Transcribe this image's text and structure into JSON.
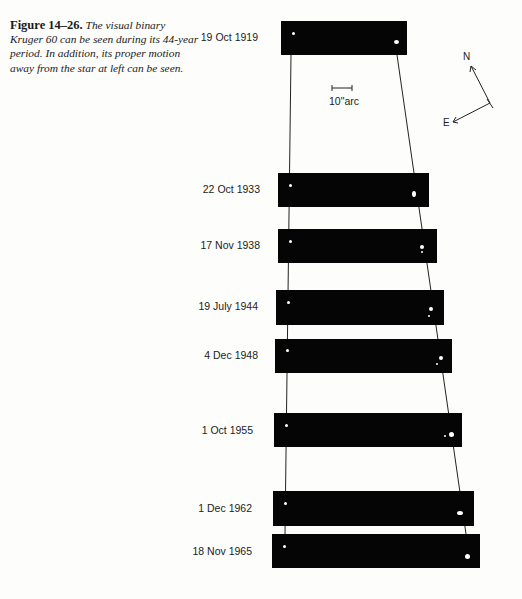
{
  "caption": {
    "figure_label": "Figure 14–26.",
    "text": "The visual binary Kruger 60 can be seen during its 44-year period. In addition, its proper motion away from the star at left can be seen."
  },
  "scale_bar": {
    "label": "10\"arc"
  },
  "compass": {
    "north": "N",
    "east": "E"
  },
  "observations": [
    {
      "date": "19 Oct 1919"
    },
    {
      "date": "22 Oct 1933"
    },
    {
      "date": "17 Nov 1938"
    },
    {
      "date": "19 July 1944"
    },
    {
      "date": "4 Dec 1948"
    },
    {
      "date": "1 Oct 1955"
    },
    {
      "date": "1 Dec 1962"
    },
    {
      "date": "18 Nov 1965"
    }
  ]
}
